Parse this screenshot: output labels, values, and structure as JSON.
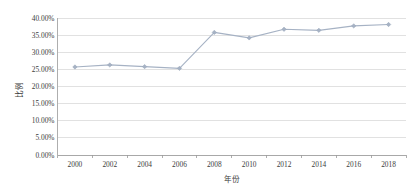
{
  "chart_data": {
    "type": "line",
    "title": "",
    "subtitle": "",
    "xlabel": "年份",
    "ylabel": "比例",
    "categories": [
      "2000",
      "2002",
      "2004",
      "2006",
      "2008",
      "2010",
      "2012",
      "2014",
      "2016",
      "2018"
    ],
    "x": [
      2000,
      2002,
      2004,
      2006,
      2008,
      2010,
      2012,
      2014,
      2016,
      2018
    ],
    "values": [
      25.7,
      26.3,
      25.8,
      25.3,
      35.8,
      34.2,
      36.7,
      36.4,
      37.7,
      38.1
    ],
    "value_labels": [
      "25.70%",
      "26.30%",
      "25.80%",
      "25.30%",
      "35.80%",
      "34.20%",
      "36.70%",
      "36.40%",
      "37.70%",
      "38.10%"
    ],
    "ylim": [
      0,
      40
    ],
    "xlim": [
      1999,
      2019
    ],
    "ytick_labels": [
      "0.00%",
      "5.00%",
      "10.00%",
      "15.00%",
      "20.00%",
      "25.00%",
      "30.00%",
      "35.00%",
      "40.00%"
    ],
    "ytick_values": [
      0,
      5,
      10,
      15,
      20,
      25,
      30,
      35,
      40
    ],
    "xtick_labels": [
      "2000",
      "2002",
      "2004",
      "2006",
      "2008",
      "2010",
      "2012",
      "2014",
      "2016",
      "2018"
    ],
    "grid": true,
    "grid_axis": "y",
    "legend": false,
    "legend_position": "none",
    "series": [
      {
        "name": "比例",
        "values": [
          25.7,
          26.3,
          25.8,
          25.3,
          35.8,
          34.2,
          36.7,
          36.4,
          37.7,
          38.1
        ],
        "color": "#a6b2c4",
        "marker": "diamond"
      }
    ],
    "colors": {
      "series": "#a6b2c4",
      "grid": "#d4d4d4",
      "axis": "#9a9a9a",
      "text": "#3c3c3c",
      "background": "#ffffff"
    }
  },
  "axes": {
    "y_title": "比例",
    "x_title": "年份"
  }
}
